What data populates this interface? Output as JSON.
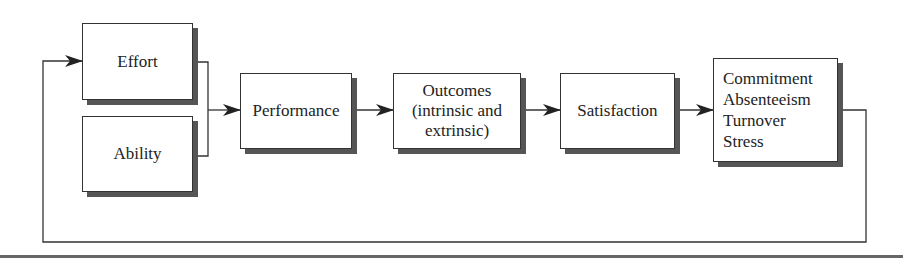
{
  "diagram": {
    "type": "flowchart",
    "nodes": {
      "effort": {
        "label": "Effort"
      },
      "ability": {
        "label": "Ability"
      },
      "performance": {
        "label": "Performance"
      },
      "outcomes": {
        "lines": [
          "Outcomes",
          "(intrinsic and",
          "extrinsic)"
        ]
      },
      "satisfaction": {
        "label": "Satisfaction"
      },
      "results": {
        "lines": [
          "Commitment",
          "Absenteeism",
          "Turnover",
          "Stress"
        ]
      }
    },
    "edges": [
      {
        "from": "effort",
        "to": "performance"
      },
      {
        "from": "ability",
        "to": "performance"
      },
      {
        "from": "performance",
        "to": "outcomes"
      },
      {
        "from": "outcomes",
        "to": "satisfaction"
      },
      {
        "from": "satisfaction",
        "to": "results"
      },
      {
        "from": "results",
        "to": "effort",
        "kind": "feedback-loop"
      }
    ],
    "colors": {
      "stroke": "#333333",
      "shadow": "#555555",
      "background": "#ffffff"
    }
  }
}
